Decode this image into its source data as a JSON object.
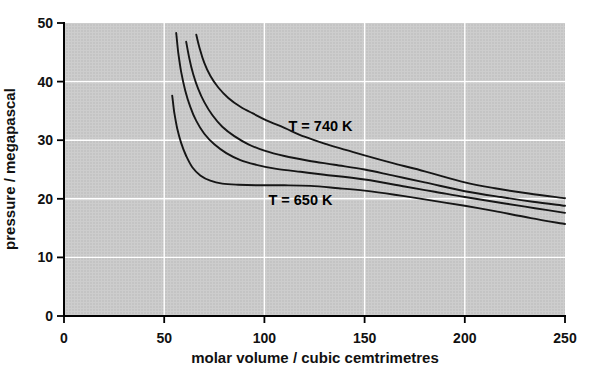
{
  "page": {
    "background": "#ffffff"
  },
  "chart_data": {
    "type": "line",
    "title": "",
    "xlabel": "molar volume / cubic cemtrimetres",
    "ylabel": "pressure / megapascal",
    "xlim": [
      0,
      250
    ],
    "ylim": [
      0,
      50
    ],
    "x_ticks": [
      0,
      50,
      100,
      150,
      200,
      250
    ],
    "y_ticks": [
      0,
      10,
      20,
      30,
      40,
      50
    ],
    "grid": {
      "show": true,
      "color": "#ffffff"
    },
    "legend": "none",
    "plot_background": "#cccccc",
    "curve_color": "#161616",
    "axis_color": "#000000",
    "annotations": [
      {
        "text": "T = 740 K",
        "x": 128,
        "y": 32.3
      },
      {
        "text": "T = 650 K",
        "x": 118,
        "y": 19.6
      }
    ],
    "series": [
      {
        "name": "T = 740 K",
        "points": [
          [
            66,
            48
          ],
          [
            68,
            45.3
          ],
          [
            70,
            43.2
          ],
          [
            73,
            41
          ],
          [
            77,
            39
          ],
          [
            82,
            37.2
          ],
          [
            88,
            35.7
          ],
          [
            94,
            34.6
          ],
          [
            101,
            33.4
          ],
          [
            110,
            32.1
          ],
          [
            120,
            30.6
          ],
          [
            132,
            29.2
          ],
          [
            141,
            28.3
          ],
          [
            150,
            27.4
          ],
          [
            165,
            26
          ],
          [
            180,
            24.7
          ],
          [
            200,
            22.8
          ],
          [
            215,
            21.8
          ],
          [
            232,
            20.9
          ],
          [
            250,
            20.1
          ]
        ]
      },
      {
        "name": "unlabeled isotherm (between T = 740 K and T = 650 K)",
        "points": [
          [
            61,
            46.8
          ],
          [
            62.5,
            44
          ],
          [
            64.5,
            41.2
          ],
          [
            67,
            38.7
          ],
          [
            70,
            36.5
          ],
          [
            74,
            34.3
          ],
          [
            79,
            32.3
          ],
          [
            85,
            30.7
          ],
          [
            92,
            29.3
          ],
          [
            100,
            28.2
          ],
          [
            110,
            27.3
          ],
          [
            122,
            26.5
          ],
          [
            135,
            25.8
          ],
          [
            150,
            25
          ],
          [
            165,
            23.9
          ],
          [
            180,
            22.8
          ],
          [
            200,
            21.3
          ],
          [
            218,
            20.3
          ],
          [
            234,
            19.5
          ],
          [
            250,
            18.8
          ]
        ]
      },
      {
        "name": "unlabeled isotherm (between T = 740 K and T = 650 K)",
        "points": [
          [
            56,
            48.3
          ],
          [
            57,
            45
          ],
          [
            58.5,
            41.6
          ],
          [
            60.5,
            38.5
          ],
          [
            63,
            35.7
          ],
          [
            66,
            33.3
          ],
          [
            70,
            31.1
          ],
          [
            75,
            29.3
          ],
          [
            81,
            27.8
          ],
          [
            88,
            26.6
          ],
          [
            96,
            25.8
          ],
          [
            106,
            25.1
          ],
          [
            118,
            24.6
          ],
          [
            130,
            24.1
          ],
          [
            150,
            23.3
          ],
          [
            170,
            22.1
          ],
          [
            185,
            21.2
          ],
          [
            200,
            20.3
          ],
          [
            220,
            19.2
          ],
          [
            235,
            18.4
          ],
          [
            250,
            17.6
          ]
        ]
      },
      {
        "name": "T = 650 K",
        "points": [
          [
            54,
            37.6
          ],
          [
            55,
            34.8
          ],
          [
            56.5,
            32
          ],
          [
            58.5,
            29.5
          ],
          [
            61,
            27.3
          ],
          [
            64,
            25.4
          ],
          [
            68,
            24
          ],
          [
            73,
            23.1
          ],
          [
            79,
            22.6
          ],
          [
            87,
            22.4
          ],
          [
            97,
            22.3
          ],
          [
            110,
            22.3
          ],
          [
            123,
            22.2
          ],
          [
            137,
            21.8
          ],
          [
            150,
            21.4
          ],
          [
            165,
            20.7
          ],
          [
            180,
            19.9
          ],
          [
            200,
            18.8
          ],
          [
            215,
            17.9
          ],
          [
            233,
            16.7
          ],
          [
            250,
            15.7
          ]
        ]
      }
    ]
  }
}
